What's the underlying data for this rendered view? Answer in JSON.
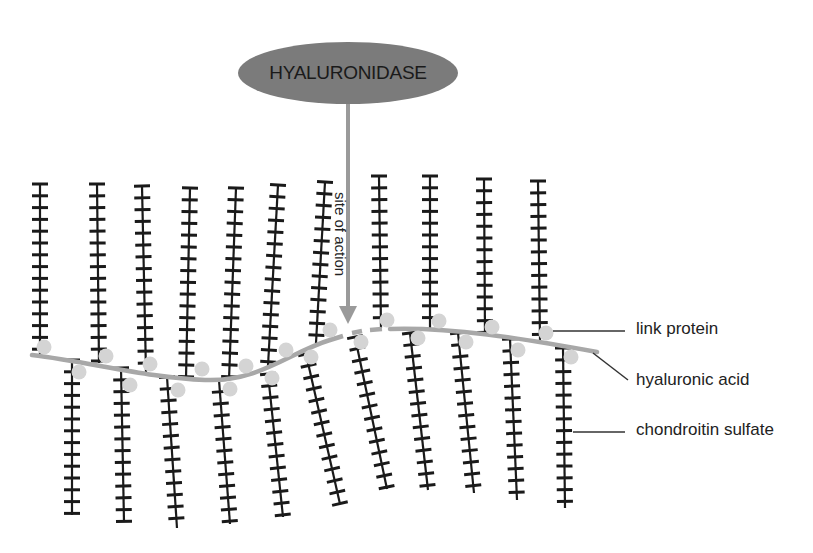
{
  "diagram": {
    "enzyme": {
      "label": "HYALURONIDASE",
      "cx": 348,
      "cy": 73,
      "rx": 110,
      "ry": 31,
      "fill": "#7b7b7b"
    },
    "arrow": {
      "label": "site of action",
      "x": 348,
      "y1": 104,
      "y2": 322,
      "color": "#9a9a9a"
    },
    "backbone": {
      "name": "hyaluronic acid",
      "color": "#a8a8a8",
      "left_path": "M32,355 C90,362 150,378 205,380 C260,382 290,352 330,340",
      "right_path": "M390,329 C450,327 520,338 597,352",
      "break_dashes": [
        [
          330,
          340,
          343,
          336
        ],
        [
          352,
          333,
          362,
          331
        ],
        [
          370,
          330,
          382,
          329
        ]
      ]
    },
    "chains_up": [
      {
        "x0": 40,
        "y0": 184,
        "x1": 40,
        "y1": 358,
        "link": [
          44,
          347
        ]
      },
      {
        "x0": 97,
        "y0": 184,
        "x1": 99,
        "y1": 363,
        "link": [
          106,
          356
        ]
      },
      {
        "x0": 142,
        "y0": 186,
        "x1": 146,
        "y1": 372,
        "link": [
          150,
          364
        ]
      },
      {
        "x0": 190,
        "y0": 188,
        "x1": 186,
        "y1": 378,
        "link": [
          202,
          369
        ]
      },
      {
        "x0": 236,
        "y0": 188,
        "x1": 229,
        "y1": 380,
        "link": [
          246,
          366
        ]
      },
      {
        "x0": 278,
        "y0": 185,
        "x1": 268,
        "y1": 366,
        "link": [
          286,
          350
        ]
      },
      {
        "x0": 325,
        "y0": 182,
        "x1": 316,
        "y1": 343,
        "link": [
          330,
          330
        ]
      },
      {
        "x0": 379,
        "y0": 176,
        "x1": 381,
        "y1": 328,
        "link": [
          387,
          320
        ]
      },
      {
        "x0": 430,
        "y0": 176,
        "x1": 430,
        "y1": 330,
        "link": [
          439,
          321
        ]
      },
      {
        "x0": 484,
        "y0": 179,
        "x1": 485,
        "y1": 335,
        "link": [
          492,
          327
        ]
      },
      {
        "x0": 538,
        "y0": 181,
        "x1": 540,
        "y1": 340,
        "link": [
          546,
          333
        ]
      }
    ],
    "chains_down": [
      {
        "x0": 72,
        "y0": 360,
        "x1": 72,
        "y1": 515,
        "link": [
          79,
          372
        ]
      },
      {
        "x0": 121,
        "y0": 368,
        "x1": 124,
        "y1": 522,
        "link": [
          130,
          385
        ]
      },
      {
        "x0": 167,
        "y0": 377,
        "x1": 177,
        "y1": 528,
        "link": [
          178,
          390
        ]
      },
      {
        "x0": 219,
        "y0": 380,
        "x1": 230,
        "y1": 524,
        "link": [
          230,
          389
        ]
      },
      {
        "x0": 268,
        "y0": 374,
        "x1": 283,
        "y1": 517,
        "link": [
          272,
          378
        ]
      },
      {
        "x0": 306,
        "y0": 354,
        "x1": 340,
        "y1": 504,
        "link": [
          311,
          357
        ]
      },
      {
        "x0": 355,
        "y0": 337,
        "x1": 387,
        "y1": 489,
        "link": [
          361,
          342
        ]
      },
      {
        "x0": 410,
        "y0": 333,
        "x1": 428,
        "y1": 490,
        "link": [
          418,
          338
        ]
      },
      {
        "x0": 458,
        "y0": 333,
        "x1": 474,
        "y1": 493,
        "link": [
          466,
          342
        ]
      },
      {
        "x0": 510,
        "y0": 339,
        "x1": 517,
        "y1": 500,
        "link": [
          518,
          350
        ]
      },
      {
        "x0": 563,
        "y0": 348,
        "x1": 565,
        "y1": 508,
        "link": [
          571,
          357
        ]
      }
    ],
    "tick_spacing": 11.8,
    "tick_half": 8,
    "chain_color": "#1a1a1a",
    "link_color": "#d4d4d4",
    "legend": [
      {
        "label": "link protein",
        "line": [
          553,
          331,
          625,
          331
        ],
        "tx": 636,
        "ty": 319
      },
      {
        "label": "hyaluronic acid",
        "line": [
          593,
          353,
          628,
          380
        ],
        "tx": 636,
        "ty": 370
      },
      {
        "label": "chondroitin sulfate",
        "line": [
          573,
          432,
          625,
          432
        ],
        "tx": 636,
        "ty": 420
      }
    ]
  }
}
